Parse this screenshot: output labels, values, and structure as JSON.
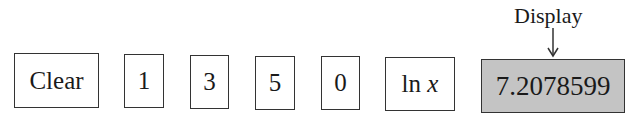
{
  "keys": [
    {
      "label": "Clear"
    },
    {
      "label": "1"
    },
    {
      "label": "3"
    },
    {
      "label": "5"
    },
    {
      "label": "0"
    },
    {
      "label": "ln",
      "var": "x"
    }
  ],
  "display": {
    "label": "Display",
    "value": "7.2078599",
    "background": "#c4c4c4"
  }
}
